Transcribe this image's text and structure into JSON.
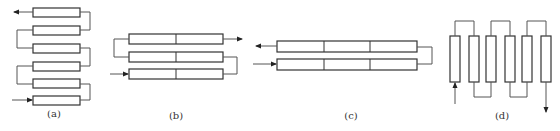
{
  "diagram": {
    "subfigures": [
      {
        "id": "a",
        "label": "(a)",
        "description": "Six single-segment tubes stacked vertically, serpentine series flow; inlet bottom-left, outlet top-left",
        "tube_count": 6,
        "segments_per_tube": 1
      },
      {
        "id": "b",
        "label": "(b)",
        "description": "Three two-segment tubes stacked, serpentine series flow; inlet bottom-left, outlet top-right",
        "tube_count": 3,
        "segments_per_tube": 2
      },
      {
        "id": "c",
        "label": "(c)",
        "description": "Two three-segment tubes, U-turn flow; inlet bottom-left, outlet top-left",
        "tube_count": 2,
        "segments_per_tube": 3
      },
      {
        "id": "d",
        "label": "(d)",
        "description": "Six vertical tubes in series, alternating top and bottom connectors; inlet bottom of first, outlet bottom of last",
        "tube_count": 6,
        "segments_per_tube": 1
      }
    ],
    "colors": {
      "stroke": "#333333",
      "connector": "#555555",
      "background": "#ffffff"
    }
  }
}
